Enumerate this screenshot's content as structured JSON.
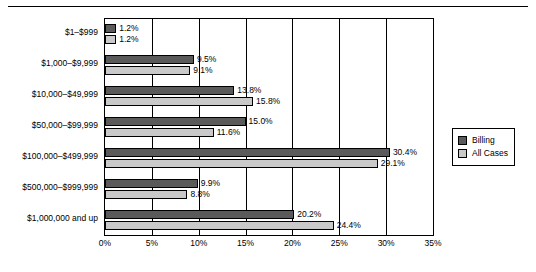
{
  "chart_data": {
    "type": "bar",
    "orientation": "horizontal",
    "title": "",
    "xlabel": "",
    "ylabel": "",
    "xlim": [
      0,
      35
    ],
    "xticks": [
      "0%",
      "5%",
      "10%",
      "15%",
      "20%",
      "25%",
      "30%",
      "35%"
    ],
    "xtick_values": [
      0,
      5,
      10,
      15,
      20,
      25,
      30,
      35
    ],
    "grid": true,
    "grid_axis": "x",
    "legend_position": "right",
    "categories": [
      "$1–$999",
      "$1,000–$9,999",
      "$10,000–$49,999",
      "$50,000–$99,999",
      "$100,000–$499,999",
      "$500,000–$999,999",
      "$1,000,000 and up"
    ],
    "series": [
      {
        "name": "Billing",
        "color": "#5a5a5a",
        "values": [
          1.2,
          9.5,
          13.8,
          15.0,
          30.4,
          9.9,
          20.2
        ],
        "labels": [
          "1.2%",
          "9.5%",
          "13.8%",
          "15.0%",
          "30.4%",
          "9.9%",
          "20.2%"
        ]
      },
      {
        "name": "All Cases",
        "color": "#c9c9c9",
        "values": [
          1.2,
          9.1,
          15.8,
          11.6,
          29.1,
          8.8,
          24.4
        ],
        "labels": [
          "1.2%",
          "9.1%",
          "15.8%",
          "11.6%",
          "29.1%",
          "8.8%",
          "24.4%"
        ]
      }
    ]
  },
  "legend": {
    "items": [
      {
        "label": "Billing"
      },
      {
        "label": "All Cases"
      }
    ]
  }
}
